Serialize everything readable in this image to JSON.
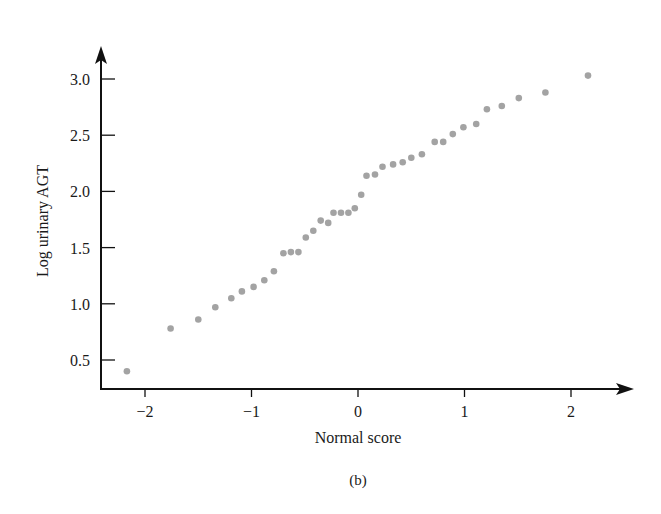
{
  "chart_data": {
    "type": "scatter",
    "title": "",
    "caption": "(b)",
    "xlabel": "Normal score",
    "ylabel": "Log urinary AGT",
    "xlim": [
      -2.4,
      2.55
    ],
    "ylim": [
      0.2,
      3.25
    ],
    "x_ticks": [
      -2,
      -1,
      0,
      1,
      2
    ],
    "x_tick_labels": [
      "−2",
      "−1",
      "0",
      "1",
      "2"
    ],
    "y_ticks": [
      0.5,
      1.0,
      1.5,
      2.0,
      2.5,
      3.0
    ],
    "y_tick_labels": [
      "0.5",
      "1.0",
      "1.5",
      "2.0",
      "2.5",
      "3.0"
    ],
    "grid": false,
    "legend": null,
    "point_color": "#a3a3a3",
    "axis_color": "#111111",
    "points": [
      {
        "x": -2.17,
        "y": 0.4
      },
      {
        "x": -1.76,
        "y": 0.78
      },
      {
        "x": -1.5,
        "y": 0.86
      },
      {
        "x": -1.34,
        "y": 0.97
      },
      {
        "x": -1.19,
        "y": 1.05
      },
      {
        "x": -1.09,
        "y": 1.11
      },
      {
        "x": -0.98,
        "y": 1.15
      },
      {
        "x": -0.88,
        "y": 1.21
      },
      {
        "x": -0.79,
        "y": 1.29
      },
      {
        "x": -0.7,
        "y": 1.45
      },
      {
        "x": -0.63,
        "y": 1.46
      },
      {
        "x": -0.56,
        "y": 1.46
      },
      {
        "x": -0.49,
        "y": 1.59
      },
      {
        "x": -0.42,
        "y": 1.65
      },
      {
        "x": -0.35,
        "y": 1.74
      },
      {
        "x": -0.28,
        "y": 1.72
      },
      {
        "x": -0.23,
        "y": 1.81
      },
      {
        "x": -0.16,
        "y": 1.81
      },
      {
        "x": -0.09,
        "y": 1.81
      },
      {
        "x": -0.03,
        "y": 1.85
      },
      {
        "x": 0.03,
        "y": 1.97
      },
      {
        "x": 0.08,
        "y": 2.14
      },
      {
        "x": 0.16,
        "y": 2.15
      },
      {
        "x": 0.23,
        "y": 2.22
      },
      {
        "x": 0.33,
        "y": 2.24
      },
      {
        "x": 0.42,
        "y": 2.26
      },
      {
        "x": 0.5,
        "y": 2.3
      },
      {
        "x": 0.6,
        "y": 2.33
      },
      {
        "x": 0.72,
        "y": 2.44
      },
      {
        "x": 0.8,
        "y": 2.44
      },
      {
        "x": 0.89,
        "y": 2.51
      },
      {
        "x": 0.99,
        "y": 2.57
      },
      {
        "x": 1.11,
        "y": 2.6
      },
      {
        "x": 1.21,
        "y": 2.73
      },
      {
        "x": 1.35,
        "y": 2.76
      },
      {
        "x": 1.51,
        "y": 2.83
      },
      {
        "x": 1.76,
        "y": 2.88
      },
      {
        "x": 2.16,
        "y": 3.03
      }
    ]
  }
}
